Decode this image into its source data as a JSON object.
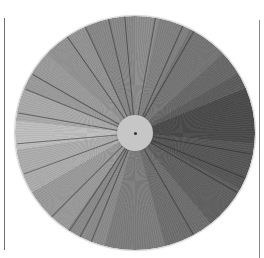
{
  "scene": {
    "description": "Photograph of a grayscale value wheel: radial segments from light (left) to dark (right) with a light central hub",
    "background": "#ffffff",
    "frame_lines": [
      {
        "side": "left",
        "x": 4,
        "y_start": 18,
        "y_end": 250,
        "color": "#6e6e6e"
      },
      {
        "side": "right",
        "x": 259,
        "y_start": 20,
        "y_end": 258,
        "color": "#8a8a8a"
      }
    ]
  },
  "wheel": {
    "center_x": 135,
    "center_y": 133,
    "radius": 119,
    "hub_color": "#c6c6c6",
    "segments": [
      {
        "from": 0,
        "to": 12,
        "color": "#8c8c8c"
      },
      {
        "from": 12,
        "to": 28,
        "color": "#808080"
      },
      {
        "from": 28,
        "to": 48,
        "color": "#747474"
      },
      {
        "from": 48,
        "to": 60,
        "color": "#686868"
      },
      {
        "from": 60,
        "to": 68,
        "color": "#5c5c5c"
      },
      {
        "from": 68,
        "to": 95,
        "color": "#4a4a4a"
      },
      {
        "from": 95,
        "to": 118,
        "color": "#565656"
      },
      {
        "from": 118,
        "to": 140,
        "color": "#606060"
      },
      {
        "from": 140,
        "to": 165,
        "color": "#6e6e6e"
      },
      {
        "from": 165,
        "to": 195,
        "color": "#7c7c7c"
      },
      {
        "from": 195,
        "to": 215,
        "color": "#8a8a8a"
      },
      {
        "from": 215,
        "to": 240,
        "color": "#999999"
      },
      {
        "from": 240,
        "to": 262,
        "color": "#acacac"
      },
      {
        "from": 262,
        "to": 276,
        "color": "#bebebe"
      },
      {
        "from": 276,
        "to": 292,
        "color": "#a9a9a9"
      },
      {
        "from": 292,
        "to": 312,
        "color": "#9a9a9a"
      },
      {
        "from": 312,
        "to": 335,
        "color": "#929292"
      },
      {
        "from": 335,
        "to": 360,
        "color": "#878787"
      }
    ],
    "ray_angles": [
      -60,
      -66,
      -80,
      -95,
      -103,
      -115,
      -125,
      -150,
      -158,
      -170,
      -185,
      -200,
      10,
      22,
      30,
      60,
      112,
      118,
      124,
      135
    ]
  }
}
